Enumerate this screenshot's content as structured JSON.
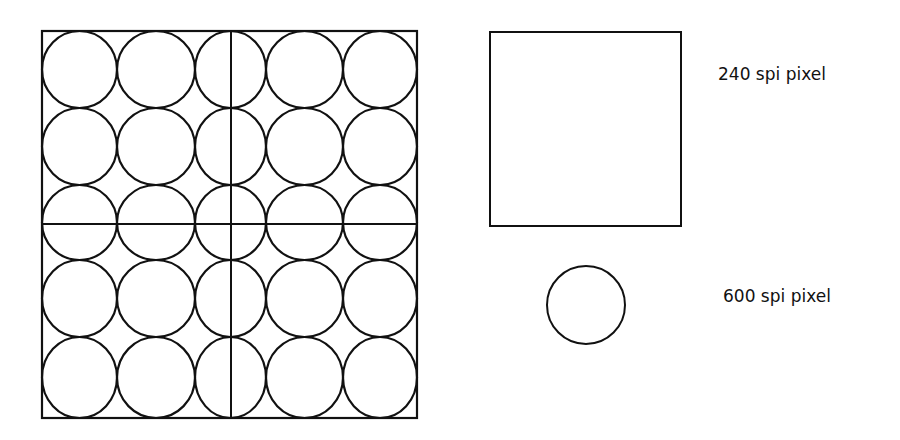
{
  "diagram": {
    "grid": {
      "outer": {
        "x": 42,
        "y": 31,
        "w": 375,
        "h": 387
      },
      "col_edges": [
        42,
        117,
        195,
        266,
        343,
        417
      ],
      "row_edges": [
        31,
        108,
        185,
        260,
        337,
        418
      ],
      "cross_lines": {
        "vertical_x": 231,
        "horizontal_y": 224
      }
    },
    "large_pixel": {
      "x": 490,
      "y": 32,
      "w": 191,
      "h": 194,
      "label": "240 spi pixel"
    },
    "small_pixel": {
      "cx": 586,
      "cy": 305,
      "r": 39,
      "label": "600 spi pixel"
    },
    "stroke_color": "#111111"
  }
}
